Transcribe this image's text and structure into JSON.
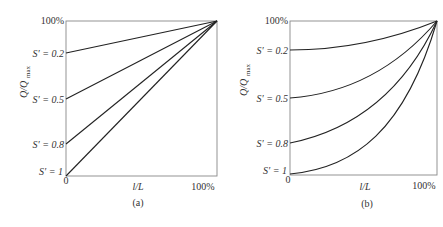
{
  "figure": {
    "panels": [
      {
        "id": "a",
        "caption": "(a)",
        "curve_shape": "linear",
        "y_axis_label": "Q/Q",
        "y_axis_label_sub": "max",
        "y_top_label": "100%",
        "x_axis_label": "l/L",
        "x_origin_label": "0",
        "x_end_label": "100%",
        "curves": [
          {
            "label": "S′ = 0.2",
            "start": 0.8
          },
          {
            "label": "S′ = 0.5",
            "start": 0.5
          },
          {
            "label": "S′ = 0.8",
            "start": 0.2
          },
          {
            "label": "S′ = 1",
            "start": 0.0
          }
        ]
      },
      {
        "id": "b",
        "caption": "(b)",
        "curve_shape": "convex",
        "y_axis_label": "Q/Q",
        "y_axis_label_sub": "max",
        "y_top_label": "100%",
        "x_axis_label": "l/L",
        "x_origin_label": "0",
        "x_end_label": "100%",
        "curves": [
          {
            "label": "S′ = 0.2",
            "start": 0.8
          },
          {
            "label": "S′ = 0.5",
            "start": 0.5
          },
          {
            "label": "S′ = 0.8",
            "start": 0.2
          },
          {
            "label": "S′ = 1",
            "start": 0.0
          }
        ]
      }
    ]
  }
}
